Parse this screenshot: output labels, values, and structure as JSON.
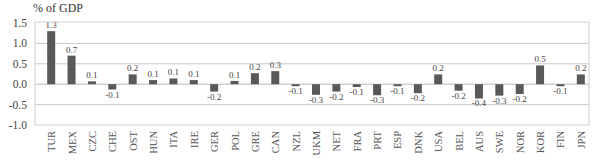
{
  "chart_data": {
    "type": "bar",
    "title": "",
    "ylabel": "% of GDP",
    "xlabel": "",
    "ylim": [
      -1.0,
      1.5
    ],
    "yticks": [
      1.5,
      1.0,
      0.5,
      0.0,
      -0.5,
      -1.0
    ],
    "ytick_labels": [
      "1.5",
      "1.0",
      "0.5",
      "0.0",
      "-0.5",
      "-1.0"
    ],
    "grid": true,
    "legend": null,
    "bar_color": "#595959",
    "categories": [
      "TUR",
      "MEX",
      "CZC",
      "CHE",
      "OST",
      "HUN",
      "ITA",
      "IRE",
      "GER",
      "POL",
      "GRE",
      "CAN",
      "NZL",
      "UKM",
      "NET",
      "FRA",
      "PRT",
      "ESP",
      "DNK",
      "USA",
      "BEL",
      "AUS",
      "SWE",
      "NOR",
      "KOR",
      "FIN",
      "JPN"
    ],
    "values": [
      1.3,
      0.7,
      0.1,
      -0.1,
      0.2,
      0.1,
      0.1,
      0.1,
      -0.2,
      0.1,
      0.2,
      0.3,
      -0.1,
      -0.3,
      -0.2,
      -0.1,
      -0.3,
      -0.1,
      -0.2,
      0.2,
      -0.2,
      -0.4,
      -0.3,
      -0.2,
      0.5,
      -0.1,
      0.2
    ],
    "bar_heights": [
      1.3,
      0.7,
      0.07,
      -0.13,
      0.24,
      0.1,
      0.14,
      0.1,
      -0.18,
      0.08,
      0.27,
      0.32,
      -0.04,
      -0.26,
      -0.18,
      -0.07,
      -0.27,
      -0.05,
      -0.22,
      0.24,
      -0.16,
      -0.35,
      -0.28,
      -0.24,
      0.46,
      -0.05,
      0.24
    ],
    "data_labels": [
      "1.3",
      "0.7",
      "0.1",
      "-0.1",
      "0.2",
      "0.1",
      "0.1",
      "0.1",
      "-0.2",
      "0.1",
      "0.2",
      "0.3",
      "-0.1",
      "-0.3",
      "-0.2",
      "-0.1",
      "-0.3",
      "-0.1",
      "-0.2",
      "0.2",
      "-0.2",
      "-0.4",
      "-0.3",
      "-0.2",
      "0.5",
      "-0.1",
      "0.2"
    ]
  }
}
